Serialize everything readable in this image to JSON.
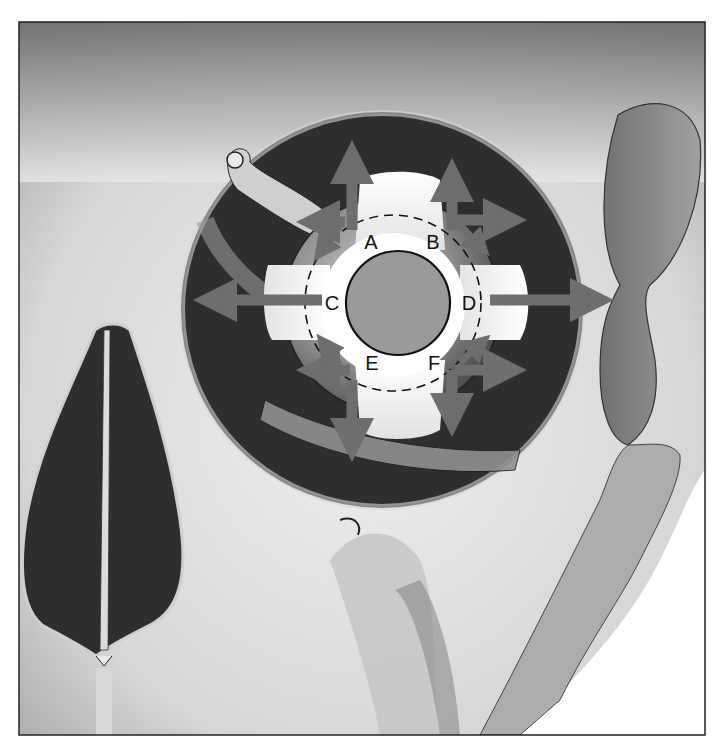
{
  "figure": {
    "frame": {
      "x": 19,
      "y": 22,
      "width": 686,
      "height": 713
    },
    "colors": {
      "background": "#ffffff",
      "bone_light": "#e8e8e8",
      "bone_mid": "#b8b8b8",
      "bone_dark": "#5a5a5a",
      "orbit_cavity": "#2e2e2e",
      "eyeball": "#8a8a8a",
      "muscle_white": "#f4f4f4",
      "iris": "#9a9a9a",
      "arrow": "#6e6e6e",
      "outline": "#111111"
    }
  },
  "labels": [
    {
      "id": "A",
      "text": "A",
      "x": 371,
      "y": 242
    },
    {
      "id": "B",
      "text": "B",
      "x": 433,
      "y": 242
    },
    {
      "id": "C",
      "text": "C",
      "x": 332,
      "y": 303
    },
    {
      "id": "D",
      "text": "D",
      "x": 469,
      "y": 303
    },
    {
      "id": "E",
      "text": "E",
      "x": 372,
      "y": 363
    },
    {
      "id": "F",
      "text": "F",
      "x": 434,
      "y": 363
    }
  ],
  "arrows": [
    {
      "name": "arrow-up",
      "direction": "up"
    },
    {
      "name": "arrow-down",
      "direction": "down"
    },
    {
      "name": "arrow-left",
      "direction": "left"
    },
    {
      "name": "arrow-right",
      "direction": "right"
    },
    {
      "name": "arrow-upper-left-pair",
      "direction": "up-left"
    },
    {
      "name": "arrow-upper-right-pair",
      "direction": "up-right"
    },
    {
      "name": "arrow-lower-left-pair",
      "direction": "down-left"
    },
    {
      "name": "arrow-lower-right-pair",
      "direction": "down-right"
    }
  ]
}
